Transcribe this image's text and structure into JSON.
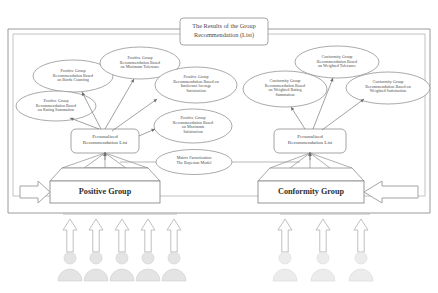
{
  "figure": {
    "title": "The Results of the Group Recommendation (List)",
    "title_lines": [
      "The Results of the Group",
      "Recommendation (List)"
    ]
  },
  "positive_branch": {
    "group_box_label": "Positive Group",
    "recommendation_list_label": "Personalized Recommendation List",
    "recommendation_list_lines": [
      "Personalized",
      "Recommendation List"
    ],
    "methods": [
      {
        "id": "borda-counting",
        "label": "Positive Group Recommendation Based on Borda Counting",
        "lines": [
          "Positive Group",
          "Recommendation Based",
          "on Borda Counting"
        ]
      },
      {
        "id": "rating-summation",
        "label": "Positive Group Recommendation Based on Rating Summation",
        "lines": [
          "Positive Group",
          "Recommendation Based",
          "on Rating Summation"
        ]
      },
      {
        "id": "minimum-tolerance",
        "label": "Positive Group Recommendation Based on Minimum Tolerance",
        "lines": [
          "Positive Group",
          "Recommendation Based",
          "on Minimum Tolerance"
        ]
      },
      {
        "id": "intolerant-average-satisfaction",
        "label": "Positive Group Recommendation Based on Intolerant Average Satisfaction",
        "lines": [
          "Positive Group",
          "Recommendation Based on",
          "Intolerant Average",
          "Satisfaction"
        ]
      },
      {
        "id": "maximum-satisfaction",
        "label": "Positive Group Recommendation Based on Maximum Satisfaction",
        "lines": [
          "Positive Group",
          "Recommendation Based",
          "on Maximum",
          "Satisfaction"
        ]
      }
    ],
    "member_count": 5
  },
  "conformity_branch": {
    "group_box_label": "Conformity Group",
    "recommendation_list_label": "Personalized Recommendation List",
    "recommendation_list_lines": [
      "Personalized",
      "Recommendation List"
    ],
    "methods": [
      {
        "id": "weighted-tolerance",
        "label": "Conformity Group Recommendation Based on Weighted Tolerance",
        "lines": [
          "Conformity Group",
          "Recommendation Based",
          "on Weighted Tolerance"
        ]
      },
      {
        "id": "weighted-rating-summation",
        "label": "Conformity Group Recommendation Based on Weighted Rating Summation",
        "lines": [
          "Conformity Group",
          "Recommendation Based",
          "on Weighted Rating",
          "Summation"
        ]
      },
      {
        "id": "weighted-satisfaction",
        "label": "Conformity Group Recommendation Based on Weighted Satisfaction",
        "lines": [
          "Conformity Group",
          "Recommendation Based on",
          "Weighted Satisfaction"
        ]
      }
    ],
    "member_count": 3
  },
  "model": {
    "label": "Matrix Factorization The Bayesian Model",
    "lines": [
      "Matrix Factorization",
      "The Bayesian Model"
    ]
  },
  "colors": {
    "stroke": "#8d8d8d",
    "stroke_light": "#b4b4b4",
    "person_fill": "#e4e4e4",
    "person_stroke": "#cfcfcf",
    "text": "#4a4a4a",
    "background": "#ffffff"
  }
}
